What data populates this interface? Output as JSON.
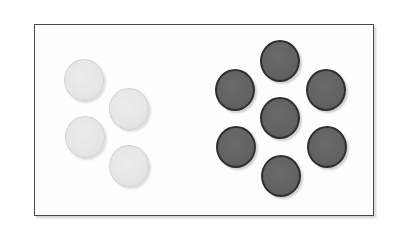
{
  "figure": {
    "frame": {
      "border_color": "#4a4a4a",
      "background": "#fdfdfd"
    },
    "groups": [
      {
        "name": "light-group",
        "count": 4,
        "color": "#e6e6e6",
        "discs": [
          {
            "cx": 84,
            "cy": 80
          },
          {
            "cx": 129,
            "cy": 109
          },
          {
            "cx": 85,
            "cy": 137
          },
          {
            "cx": 129,
            "cy": 166
          }
        ]
      },
      {
        "name": "dark-group",
        "count": 7,
        "color": "#626262",
        "discs": [
          {
            "cx": 280,
            "cy": 61
          },
          {
            "cx": 235,
            "cy": 90
          },
          {
            "cx": 326,
            "cy": 90
          },
          {
            "cx": 280,
            "cy": 118
          },
          {
            "cx": 236,
            "cy": 147
          },
          {
            "cx": 327,
            "cy": 147
          },
          {
            "cx": 281,
            "cy": 176
          }
        ]
      }
    ]
  }
}
